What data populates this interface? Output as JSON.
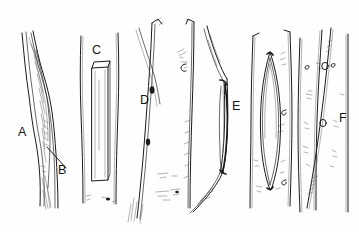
{
  "figure": {
    "medium": "pen-and-ink scientific illustration",
    "background_color": "#fefefe",
    "ink_color": "#1a1a1a",
    "width_px": 359,
    "height_px": 232,
    "caption": "",
    "panel_labels": [
      {
        "id": "A",
        "text": "A",
        "x": 18,
        "y": 136
      },
      {
        "id": "B",
        "text": "B",
        "x": 58,
        "y": 174
      },
      {
        "id": "C",
        "text": "C",
        "x": 92,
        "y": 54
      },
      {
        "id": "D",
        "text": "D",
        "x": 140,
        "y": 104
      },
      {
        "id": "E",
        "text": "E",
        "x": 232,
        "y": 110
      },
      {
        "id": "F",
        "text": "F",
        "x": 339,
        "y": 122
      }
    ],
    "leader_lines": [
      {
        "id": "B",
        "from_x": 66,
        "from_y": 168,
        "to_x": 47,
        "to_y": 147
      }
    ],
    "panels": [
      {
        "id": "A",
        "name": "panel-a-fiber",
        "description": "slender sinuous fibre with a long tapering split and fine internal striations; label B marks the split tip"
      },
      {
        "id": "C",
        "name": "panel-c-fiber",
        "description": "straight broad fibre containing a long rectangular prismatic crystal inclusion"
      },
      {
        "id": "D",
        "name": "panel-d-fiber",
        "description": "narrow fibre bundle with two small dark nodules and neighbouring fibre with fine side hairs"
      },
      {
        "id": "E",
        "name": "panel-e-fiber",
        "description": "kinked fibre enclosing a long dark lens-shaped inclusion"
      },
      {
        "id": "E2",
        "name": "panel-e2-fiber",
        "description": "straight fibre with a large spindle- or lens-shaped vacuole outlined in double contour"
      },
      {
        "id": "F",
        "name": "panel-f-fiber",
        "description": "group of parallel fibres bearing small round pits and scattered speckles"
      }
    ]
  }
}
